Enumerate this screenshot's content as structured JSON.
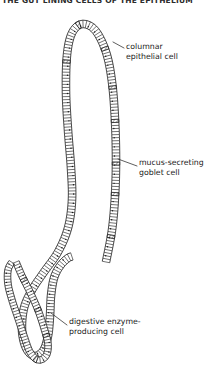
{
  "figure": {
    "name": "intestinal-epithelium-diagram",
    "header_partial_text": "THE GUT LINING   CELLS OF THE EPITHELIUM",
    "line_color": "#1a1a1a",
    "fill_color": "#ffffff",
    "background": "#ffffff",
    "labels": [
      {
        "id": "columnar",
        "line1": "columnar",
        "line2": "epithelial cell",
        "leader": "short diagonal from text to right-hand cell column"
      },
      {
        "id": "goblet",
        "line1": "mucus-secreting",
        "line2": "goblet cell",
        "leader": "short diagonal from text up-left to hatched goblet cell"
      },
      {
        "id": "enzyme",
        "line1": "digestive enzyme-",
        "line2": "producing cell",
        "leader": "short diagonal from text up-left to lower crypt cell"
      }
    ],
    "structures": [
      {
        "name": "villus",
        "shape": "tall inverted-U",
        "cell_count_approx": 150
      },
      {
        "name": "crypt",
        "shape": "small V",
        "cell_count_approx": 60
      }
    ]
  }
}
